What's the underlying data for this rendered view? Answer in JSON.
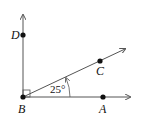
{
  "diagram": {
    "points": [
      {
        "label": "D",
        "x": 23,
        "y": 35
      },
      {
        "label": "B",
        "x": 23,
        "y": 97
      },
      {
        "label": "C",
        "x": 100,
        "y": 61
      },
      {
        "label": "A",
        "x": 103,
        "y": 97
      }
    ],
    "angle_label": "25°",
    "right_angle_marker": "at B between BD and BC",
    "colors": {
      "line": "#555555",
      "point": "#111111"
    }
  }
}
